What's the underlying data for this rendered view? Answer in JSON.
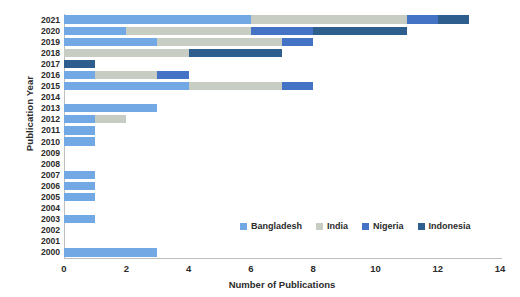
{
  "chart_data": {
    "type": "bar",
    "orientation": "horizontal",
    "stacked": true,
    "title": "",
    "xlabel": "Number of Publications",
    "ylabel": "Publication Year",
    "xlim": [
      0,
      14
    ],
    "xticks": [
      0,
      2,
      4,
      6,
      8,
      10,
      12,
      14
    ],
    "grid": false,
    "legend_position": "inside-bottom-right",
    "categories": [
      "2021",
      "2020",
      "2019",
      "2018",
      "2017",
      "2016",
      "2015",
      "2014",
      "2013",
      "2012",
      "2011",
      "2010",
      "2009",
      "2008",
      "2007",
      "2006",
      "2005",
      "2004",
      "2003",
      "2002",
      "2001",
      "2000"
    ],
    "series": [
      {
        "name": "Bangladesh",
        "color": "#72A8E3",
        "values": [
          6,
          2,
          3,
          0,
          0,
          1,
          4,
          0,
          3,
          1,
          1,
          1,
          0,
          0,
          1,
          1,
          1,
          0,
          1,
          0,
          0,
          3
        ]
      },
      {
        "name": "India",
        "color": "#C8CDC3",
        "values": [
          5,
          4,
          4,
          4,
          0,
          2,
          3,
          0,
          0,
          1,
          0,
          0,
          0,
          0,
          0,
          0,
          0,
          0,
          0,
          0,
          0,
          0
        ]
      },
      {
        "name": "Nigeria",
        "color": "#4472C4",
        "values": [
          1,
          2,
          1,
          0,
          0,
          1,
          1,
          0,
          0,
          0,
          0,
          0,
          0,
          0,
          0,
          0,
          0,
          0,
          0,
          0,
          0,
          0
        ]
      },
      {
        "name": "Indonesia",
        "color": "#2E5E8E",
        "values": [
          1,
          3,
          0,
          3,
          1,
          0,
          0,
          0,
          0,
          0,
          0,
          0,
          0,
          0,
          0,
          0,
          0,
          0,
          0,
          0,
          0,
          0
        ]
      }
    ],
    "totals": [
      13,
      11,
      8,
      7,
      1,
      4,
      8,
      0,
      3,
      2,
      1,
      1,
      0,
      0,
      1,
      1,
      1,
      0,
      1,
      0,
      0,
      3
    ]
  },
  "legend": {
    "items": [
      {
        "label": "Bangladesh",
        "color": "#72A8E3"
      },
      {
        "label": "India",
        "color": "#C8CDC3"
      },
      {
        "label": "Nigeria",
        "color": "#4472C4"
      },
      {
        "label": "Indonesia",
        "color": "#2E5E8E"
      }
    ]
  }
}
